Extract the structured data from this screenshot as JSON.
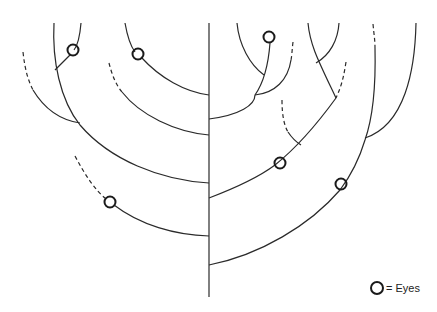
{
  "diagram": {
    "type": "branching tree",
    "trunk": {
      "x": 209,
      "y_top": 23,
      "y_bottom": 297
    },
    "eye_marker_count": 6,
    "colors": {
      "stroke": "#2a2a2a",
      "background": "#ffffff"
    }
  },
  "legend": {
    "symbol": "circle",
    "label": "= Eyes"
  }
}
